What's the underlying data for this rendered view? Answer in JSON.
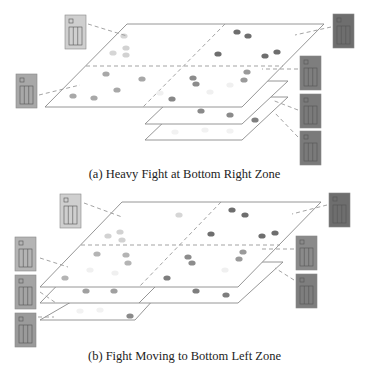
{
  "figure_a": {
    "caption": "(a) Heavy Fight at Bottom Right Zone",
    "main_plane": [
      [
        127,
        24
      ],
      [
        324,
        24
      ],
      [
        242,
        107
      ],
      [
        45,
        107
      ]
    ],
    "zone_h": [
      [
        86,
        66
      ],
      [
        283,
        66
      ]
    ],
    "zone_v": [
      [
        225,
        24
      ],
      [
        143,
        107
      ]
    ],
    "sub_planes": [
      {
        "points": [
          [
            190,
            81
          ],
          [
            288,
            81
          ],
          [
            242,
            124
          ],
          [
            145,
            124
          ]
        ],
        "divider": null
      },
      {
        "points": [
          [
            190,
            97
          ],
          [
            288,
            97
          ],
          [
            242,
            140
          ],
          [
            145,
            140
          ]
        ],
        "divider": null
      }
    ],
    "servers": [
      {
        "x": 65,
        "y": 15,
        "color": "#cfcfcf",
        "link": [
          [
            88,
            24
          ],
          [
            127,
            36
          ]
        ]
      },
      {
        "x": 16,
        "y": 74,
        "color": "#a8a8a8",
        "link": [
          [
            39,
            95
          ],
          [
            80,
            85
          ]
        ]
      },
      {
        "x": 333,
        "y": 14,
        "color": "#6e6e6e",
        "link": [
          [
            331,
            27
          ],
          [
            295,
            35
          ]
        ]
      },
      {
        "x": 300,
        "y": 56,
        "color": "#7e7e7e",
        "link": [
          [
            298,
            69
          ],
          [
            262,
            69
          ]
        ]
      },
      {
        "x": 300,
        "y": 94,
        "color": "#7a7a7a",
        "link": [
          [
            298,
            110
          ],
          [
            272,
            100
          ]
        ]
      },
      {
        "x": 300,
        "y": 131,
        "color": "#7a7a7a",
        "link": [
          [
            298,
            137
          ],
          [
            274,
            112
          ]
        ]
      }
    ],
    "dots": [
      {
        "x": 124,
        "y": 36,
        "c": "#d6d6d6"
      },
      {
        "x": 113,
        "y": 53,
        "c": "#d6d6d6"
      },
      {
        "x": 126,
        "y": 48,
        "c": "#d2d2d2"
      },
      {
        "x": 126,
        "y": 55,
        "c": "#d2d2d2"
      },
      {
        "x": 106,
        "y": 74,
        "c": "#a8a8a8"
      },
      {
        "x": 142,
        "y": 79,
        "c": "#a8a8a8"
      },
      {
        "x": 117,
        "y": 90,
        "c": "#a8a8a8"
      },
      {
        "x": 73,
        "y": 96,
        "c": "#a8a8a8"
      },
      {
        "x": 94,
        "y": 98,
        "c": "#a8a8a8"
      },
      {
        "x": 172,
        "y": 99,
        "c": "#888888"
      },
      {
        "x": 193,
        "y": 78,
        "c": "#8c8c8c"
      },
      {
        "x": 196,
        "y": 84,
        "c": "#8c8c8c"
      },
      {
        "x": 218,
        "y": 54,
        "c": "#6e6e6e"
      },
      {
        "x": 237,
        "y": 32,
        "c": "#6e6e6e"
      },
      {
        "x": 248,
        "y": 36,
        "c": "#6e6e6e"
      },
      {
        "x": 265,
        "y": 56,
        "c": "#6e6e6e"
      },
      {
        "x": 277,
        "y": 52,
        "c": "#6e6e6e"
      },
      {
        "x": 247,
        "y": 72,
        "c": "#9a9a9a"
      },
      {
        "x": 244,
        "y": 80,
        "c": "#9a9a9a"
      },
      {
        "x": 201,
        "y": 111,
        "c": "#8a8a8a"
      },
      {
        "x": 230,
        "y": 115,
        "c": "#8a8a8a"
      },
      {
        "x": 255,
        "y": 120,
        "c": "#7e7e7e"
      },
      {
        "x": 160,
        "y": 93,
        "c": "#f0f0f0"
      },
      {
        "x": 210,
        "y": 92,
        "c": "#f0f0f0"
      },
      {
        "x": 230,
        "y": 85,
        "c": "#f0f0f0"
      },
      {
        "x": 175,
        "y": 132,
        "c": "#f2f2f2"
      },
      {
        "x": 205,
        "y": 130,
        "c": "#f2f2f2"
      },
      {
        "x": 230,
        "y": 131,
        "c": "#f2f2f2"
      }
    ]
  },
  "figure_b": {
    "caption": "(b) Fight Moving to Bottom Left Zone",
    "main_plane": [
      [
        122,
        202
      ],
      [
        321,
        202
      ],
      [
        238,
        287
      ],
      [
        40,
        287
      ]
    ],
    "zone_h": [
      [
        81,
        245
      ],
      [
        280,
        245
      ]
    ],
    "zone_v": [
      [
        221,
        202
      ],
      [
        139,
        287
      ]
    ],
    "sub_planes": [
      {
        "points": [
          [
            80,
            262
          ],
          [
            283,
            262
          ],
          [
            238,
            303
          ],
          [
            40,
            303
          ]
        ],
        "divider": [
          [
            180,
            262
          ],
          [
            139,
            303
          ]
        ]
      },
      {
        "points": [
          [
            78,
            298
          ],
          [
            155,
            298
          ],
          [
            135,
            320
          ],
          [
            40,
            320
          ]
        ],
        "divider": null
      }
    ],
    "servers": [
      {
        "x": 60,
        "y": 194,
        "color": "#cfcfcf",
        "link": [
          [
            84,
            203
          ],
          [
            122,
            217
          ]
        ]
      },
      {
        "x": 15,
        "y": 237,
        "color": "#b4b4b4",
        "link": [
          [
            40,
            258
          ],
          [
            68,
            267
          ]
        ]
      },
      {
        "x": 15,
        "y": 275,
        "color": "#a4a4a4",
        "link": [
          [
            40,
            292
          ],
          [
            56,
            303
          ]
        ]
      },
      {
        "x": 15,
        "y": 313,
        "color": "#9a9a9a",
        "link": [
          [
            38,
            317
          ],
          [
            54,
            317
          ]
        ]
      },
      {
        "x": 329,
        "y": 193,
        "color": "#6e6e6e",
        "link": [
          [
            327,
            205
          ],
          [
            292,
            214
          ]
        ]
      },
      {
        "x": 296,
        "y": 236,
        "color": "#8a8a8a",
        "link": [
          [
            294,
            249
          ],
          [
            262,
            249
          ]
        ]
      },
      {
        "x": 296,
        "y": 274,
        "color": "#7e7e7e",
        "link": [
          [
            294,
            280
          ],
          [
            275,
            268
          ]
        ]
      }
    ],
    "dots": [
      {
        "x": 179,
        "y": 215,
        "c": "#d6d6d6"
      },
      {
        "x": 120,
        "y": 232,
        "c": "#d2d2d2"
      },
      {
        "x": 108,
        "y": 236,
        "c": "#d2d2d2"
      },
      {
        "x": 122,
        "y": 240,
        "c": "#d2d2d2"
      },
      {
        "x": 97,
        "y": 254,
        "c": "#b4b4b4"
      },
      {
        "x": 126,
        "y": 255,
        "c": "#b4b4b4"
      },
      {
        "x": 128,
        "y": 263,
        "c": "#b4b4b4"
      },
      {
        "x": 65,
        "y": 278,
        "c": "#b4b4b4"
      },
      {
        "x": 232,
        "y": 210,
        "c": "#6e6e6e"
      },
      {
        "x": 245,
        "y": 215,
        "c": "#6e6e6e"
      },
      {
        "x": 211,
        "y": 234,
        "c": "#6e6e6e"
      },
      {
        "x": 262,
        "y": 236,
        "c": "#6e6e6e"
      },
      {
        "x": 275,
        "y": 233,
        "c": "#6e6e6e"
      },
      {
        "x": 243,
        "y": 252,
        "c": "#9a9a9a"
      },
      {
        "x": 239,
        "y": 259,
        "c": "#9a9a9a"
      },
      {
        "x": 188,
        "y": 257,
        "c": "#8c8c8c"
      },
      {
        "x": 192,
        "y": 263,
        "c": "#8c8c8c"
      },
      {
        "x": 167,
        "y": 278,
        "c": "#7e7e7e"
      },
      {
        "x": 86,
        "y": 291,
        "c": "#a0a0a0"
      },
      {
        "x": 114,
        "y": 291,
        "c": "#a0a0a0"
      },
      {
        "x": 196,
        "y": 291,
        "c": "#7e7e7e"
      },
      {
        "x": 226,
        "y": 295,
        "c": "#7e7e7e"
      },
      {
        "x": 130,
        "y": 316,
        "c": "#8a8a8a"
      },
      {
        "x": 90,
        "y": 270,
        "c": "#f0f0f0"
      },
      {
        "x": 115,
        "y": 273,
        "c": "#f0f0f0"
      },
      {
        "x": 225,
        "y": 270,
        "c": "#f0f0f0"
      },
      {
        "x": 80,
        "y": 311,
        "c": "#f2f2f2"
      },
      {
        "x": 100,
        "y": 310,
        "c": "#f2f2f2"
      }
    ]
  },
  "style": {
    "plane_stroke": "#8a8a8a",
    "dash_color": "#999999",
    "server_inner_stroke": "#555555"
  }
}
